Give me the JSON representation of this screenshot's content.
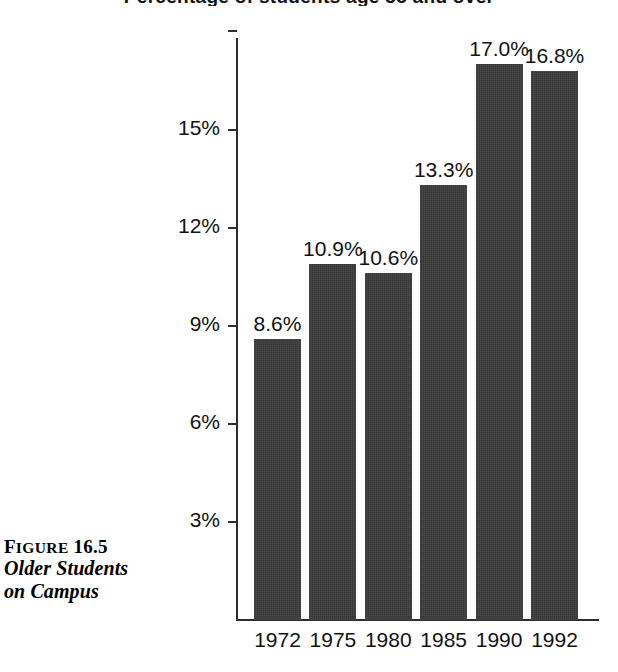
{
  "figure": {
    "partial_title": "Percentage of students age 35 and over",
    "caption_label_prefix": "F",
    "caption_label_smallcaps": "IGURE",
    "caption_label_number": "16.5",
    "caption_line_1": "Older Students",
    "caption_line_2": "on Campus"
  },
  "colors": {
    "bar_fill": "#3b3b3b",
    "axis": "#2e2e2e",
    "text": "#111111",
    "background": "#ffffff"
  },
  "chart_data": {
    "type": "bar",
    "title": "",
    "xlabel": "",
    "ylabel": "",
    "categories": [
      "1972",
      "1975",
      "1980",
      "1985",
      "1990",
      "1992"
    ],
    "values": [
      8.6,
      10.9,
      10.6,
      13.3,
      17.0,
      16.8
    ],
    "value_labels": [
      "8.6%",
      "10.9%",
      "10.6%",
      "13.3%",
      "17.0%",
      "16.8%"
    ],
    "ytick_values": [
      3,
      6,
      9,
      12,
      15
    ],
    "ytick_labels": [
      "3%",
      "6%",
      "9%",
      "12%",
      "15%"
    ],
    "ylim": [
      0,
      18
    ],
    "grid": false,
    "legend": "none"
  }
}
